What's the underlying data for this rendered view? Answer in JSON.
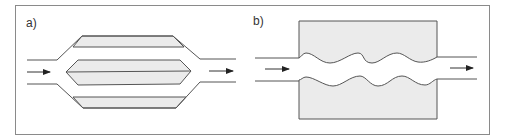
{
  "figure": {
    "panels": [
      {
        "id": "a",
        "label": "a)",
        "description": "Channel splitting into three parallel sub-channels around two shaded bands and a central hexagonal shaded body, then recombining",
        "flow_direction": "left-to-right"
      },
      {
        "id": "b",
        "label": "b)",
        "description": "Straight channel passing through a shaded rectangular block with wavy (sinusoidal) walls",
        "flow_direction": "left-to-right"
      }
    ]
  },
  "colors": {
    "line": "#555555",
    "fill": "#ebebeb",
    "frame": "#8a8a8a",
    "background": "#ffffff"
  }
}
